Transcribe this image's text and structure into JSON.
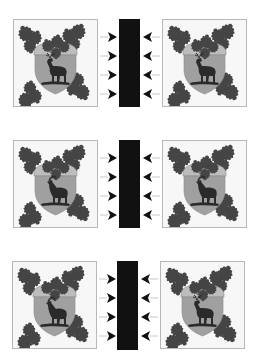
{
  "figure": {
    "background": "#ffffff",
    "colors": {
      "panel_border": "#b8b8b8",
      "panel_fill": "#f7f7f7",
      "leaf": "#454545",
      "acorn_cap": "#bdbdbd",
      "shield": "#a0a0a0",
      "shield_outline": "#8a8a8a",
      "animal": "#2a2a2a",
      "bar": "#111111",
      "arrow": "#111111",
      "arrow_stem": "#c8c8c8"
    },
    "rows": [
      {
        "top": 19,
        "left_emblem": {
          "animal": "stag"
        },
        "right_emblem": {
          "animal": "stag"
        },
        "arrows_left": {
          "direction": "right",
          "count": 4
        },
        "arrows_right": {
          "direction": "left",
          "count": 4
        }
      },
      {
        "top": 140,
        "left_emblem": {
          "animal": "goat"
        },
        "right_emblem": {
          "animal": "goat"
        },
        "arrows_left": {
          "direction": "right",
          "count": 4
        },
        "arrows_right": {
          "direction": "left",
          "count": 4
        }
      },
      {
        "top": 261,
        "left_emblem": {
          "animal": "goat"
        },
        "right_emblem": {
          "animal": "stag"
        },
        "arrows_left": {
          "direction": "right",
          "count": 4
        },
        "arrows_right": {
          "direction": "left",
          "count": 4
        }
      }
    ]
  }
}
